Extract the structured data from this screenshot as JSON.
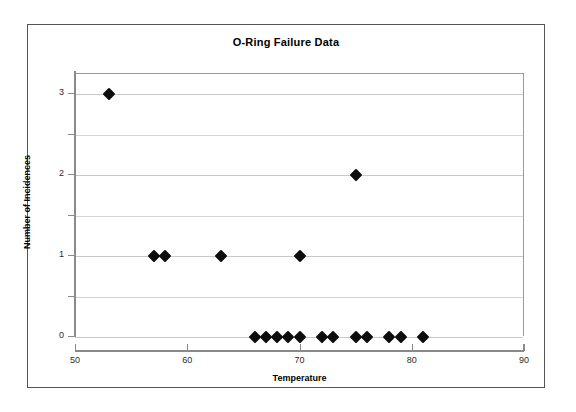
{
  "chart_data": {
    "type": "scatter",
    "title": "O-Ring Failure Data",
    "xlabel": "Temperature",
    "ylabel": "Number of Incidences",
    "xlim": [
      50,
      90
    ],
    "ylim": [
      0,
      3.25
    ],
    "xticks": [
      50,
      60,
      70,
      80,
      90
    ],
    "yticks": [
      0,
      1,
      2,
      3
    ],
    "gridlines": [
      0,
      0.5,
      1,
      1.5,
      2,
      2.5,
      3
    ],
    "grid": true,
    "legend": "none",
    "marker": "black-diamond",
    "series": [
      {
        "name": "O-Ring Incidences",
        "x": [
          53,
          57,
          58,
          63,
          66,
          67,
          68,
          69,
          70,
          70,
          72,
          73,
          75,
          75,
          76,
          78,
          79,
          81
        ],
        "y": [
          3,
          1,
          1,
          1,
          0,
          0,
          0,
          0,
          0,
          1,
          0,
          0,
          0,
          2,
          0,
          0,
          0,
          0
        ],
        "points": [
          {
            "temperature": 53,
            "incidences": 3
          },
          {
            "temperature": 57,
            "incidences": 1
          },
          {
            "temperature": 58,
            "incidences": 1
          },
          {
            "temperature": 63,
            "incidences": 1
          },
          {
            "temperature": 66,
            "incidences": 0
          },
          {
            "temperature": 67,
            "incidences": 0
          },
          {
            "temperature": 68,
            "incidences": 0
          },
          {
            "temperature": 69,
            "incidences": 0
          },
          {
            "temperature": 70,
            "incidences": 0
          },
          {
            "temperature": 70,
            "incidences": 1
          },
          {
            "temperature": 72,
            "incidences": 0
          },
          {
            "temperature": 73,
            "incidences": 0
          },
          {
            "temperature": 75,
            "incidences": 0
          },
          {
            "temperature": 75,
            "incidences": 2
          },
          {
            "temperature": 76,
            "incidences": 0
          },
          {
            "temperature": 78,
            "incidences": 0
          },
          {
            "temperature": 79,
            "incidences": 0
          },
          {
            "temperature": 81,
            "incidences": 0
          }
        ]
      }
    ],
    "colors": {
      "marker": "#0d0d0d",
      "gridline": "#d4d4d4",
      "axis": "#8a8a8a",
      "frame": "#555555",
      "background": "#ffffff",
      "text": "#000000"
    }
  }
}
